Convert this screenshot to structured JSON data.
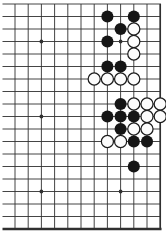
{
  "diagram": {
    "kind": "go-board-diagram",
    "background_color": "#ffffff",
    "line_color": "#303030",
    "board": {
      "visible_cols": 12,
      "visible_rows": 19,
      "origin_x": 15,
      "origin_y": 4,
      "col_spacing": 13.2,
      "row_spacing": 12.5,
      "h_line_overhang_left": 12.5,
      "line_width": 0.9,
      "right_edge_width": 1.7,
      "bottom_edge_width": 2.6,
      "star_radius": 1.9,
      "stone_radius": 6.05,
      "stone_black_fill": "#161616",
      "stone_white_fill": "#fcfcfc",
      "stone_outline": "#1d1d1d",
      "stone_outline_width": 1.25
    },
    "star_points": [
      [
        3,
        4
      ],
      [
        9,
        4
      ],
      [
        3,
        10
      ],
      [
        3,
        16
      ],
      [
        9,
        16
      ]
    ],
    "stones": {
      "black": [
        [
          8,
          2
        ],
        [
          10,
          2
        ],
        [
          9,
          3
        ],
        [
          8,
          4
        ],
        [
          8,
          6
        ],
        [
          9,
          6
        ],
        [
          9,
          9
        ],
        [
          8,
          10
        ],
        [
          9,
          10
        ],
        [
          10,
          10
        ],
        [
          9,
          11
        ],
        [
          10,
          12
        ],
        [
          11,
          12
        ],
        [
          10,
          14
        ]
      ],
      "white": [
        [
          10,
          3
        ],
        [
          10,
          4
        ],
        [
          10,
          5
        ],
        [
          7,
          7
        ],
        [
          8,
          7
        ],
        [
          9,
          7
        ],
        [
          10,
          7
        ],
        [
          10,
          9
        ],
        [
          11,
          9
        ],
        [
          12,
          9
        ],
        [
          11,
          10
        ],
        [
          12,
          10
        ],
        [
          10,
          11
        ],
        [
          11,
          11
        ],
        [
          8,
          12
        ],
        [
          9,
          12
        ]
      ]
    }
  }
}
